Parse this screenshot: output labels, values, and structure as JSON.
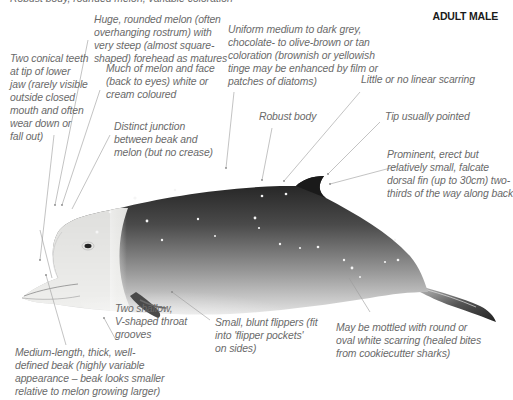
{
  "header": {
    "title": "ADULT MALE",
    "cut_text": "Robust body, rounded melon, variable coloration"
  },
  "annotations": {
    "teeth": [
      "Two conical teeth",
      "at tip of lower",
      "jaw (rarely visible",
      "outside closed",
      "mouth and often",
      "wear down or",
      "fall out)"
    ],
    "melon": [
      "Huge, rounded melon (often",
      "overhanging rostrum) with",
      "very steep (almost square-",
      "shaped) forehead as matures"
    ],
    "face": [
      "Much of melon and face",
      "(back to eyes) white or",
      "cream coloured"
    ],
    "junction": [
      "Distinct junction",
      "between beak and",
      "melon (but no crease)"
    ],
    "coloration": [
      "Uniform medium to dark grey,",
      "chocolate- to olive-brown or tan",
      "coloration (brownish or yellowish",
      "tinge may be enhanced by film or",
      "patches of diatoms)"
    ],
    "scarring": [
      "Little or no linear scarring"
    ],
    "body": [
      "Robust body"
    ],
    "tip": [
      "Tip usually pointed"
    ],
    "dorsal_fin": [
      "Prominent, erect but",
      "relatively small, falcate",
      "dorsal fin (up to 30cm) two-",
      "thirds of the way along back"
    ],
    "throat": [
      "Two shallow,",
      "V-shaped throat",
      "grooves"
    ],
    "flippers": [
      "Small, blunt flippers (fit",
      "into 'flipper pockets'",
      "on sides)"
    ],
    "mottled": [
      "May be mottled with round or",
      "oval white scarring (healed bites",
      "from cookiecutter sharks)"
    ],
    "beak": [
      "Medium-length, thick, well-",
      "defined beak (highly variable",
      "appearance – beak looks smaller",
      "relative to melon growing larger)"
    ]
  },
  "colors": {
    "text": "#6a6a6a",
    "leader": "#9a9a9a",
    "body_dark": "#2b2b2b",
    "body_light": "#d9d9d9",
    "head_white": "#f2f2f0"
  }
}
